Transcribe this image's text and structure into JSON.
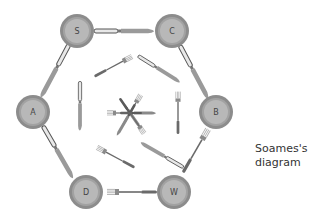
{
  "diagram": {
    "caption_line1": "Soames's",
    "caption_line2": "diagram",
    "colors": {
      "plate_rim": "#8c8c8c",
      "plate_inner": "#b4b4b4",
      "plate_ring": "#a2a2a2",
      "cutlery_dark": "#5a5a5a",
      "cutlery_light": "#9a9a9a",
      "background": "#ffffff"
    },
    "plates": [
      {
        "label": "S",
        "cx": 77,
        "cy": 31
      },
      {
        "label": "C",
        "cx": 172,
        "cy": 31
      },
      {
        "label": "B",
        "cx": 216,
        "cy": 112
      },
      {
        "label": "W",
        "cx": 174,
        "cy": 192
      },
      {
        "label": "D",
        "cx": 86,
        "cy": 192
      },
      {
        "label": "A",
        "cx": 33,
        "cy": 112
      }
    ],
    "outer_cutlery": [
      {
        "type": "knife",
        "between": [
          "S",
          "C"
        ]
      },
      {
        "type": "knife",
        "between": [
          "C",
          "B"
        ]
      },
      {
        "type": "fork",
        "between": [
          "B",
          "W"
        ]
      },
      {
        "type": "fork",
        "between": [
          "W",
          "D"
        ]
      },
      {
        "type": "knife",
        "between": [
          "D",
          "A"
        ]
      },
      {
        "type": "knife",
        "between": [
          "A",
          "S"
        ]
      }
    ],
    "inner_cutlery": [
      {
        "type": "fork",
        "position": "top-left"
      },
      {
        "type": "knife",
        "position": "top-right"
      },
      {
        "type": "fork",
        "position": "right"
      },
      {
        "type": "knife",
        "position": "bottom-right"
      },
      {
        "type": "fork",
        "position": "bottom-left"
      },
      {
        "type": "knife",
        "position": "left"
      }
    ],
    "center_cutlery": [
      {
        "type": "knife"
      },
      {
        "type": "fork"
      },
      {
        "type": "fork"
      },
      {
        "type": "knife"
      },
      {
        "type": "fork"
      },
      {
        "type": "knife"
      }
    ]
  }
}
